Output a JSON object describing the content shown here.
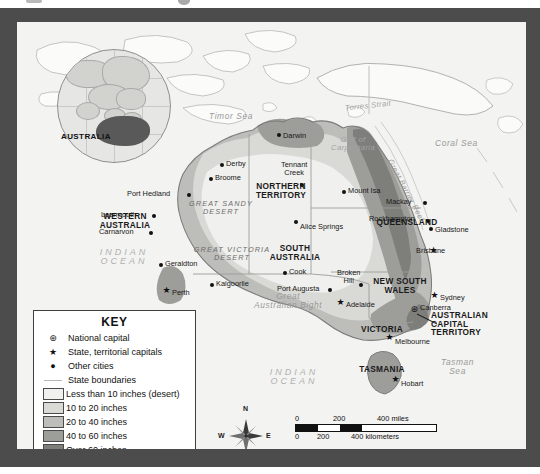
{
  "title_alt": "Australia — Average Annual Precipitation Map",
  "inset": {
    "label": "AUSTRALIA"
  },
  "key": {
    "title": "KEY",
    "symbol_rows": [
      {
        "symbol": "national-capital-icon",
        "glyph": "⊛",
        "label": "National capital"
      },
      {
        "symbol": "state-capital-icon",
        "glyph": "★",
        "label": "State, territorial capitals"
      },
      {
        "symbol": "other-city-icon",
        "glyph": "●",
        "label": "Other cities"
      },
      {
        "symbol": "state-boundary-icon",
        "glyph": "",
        "label": "State boundaries"
      }
    ],
    "swatch_rows": [
      {
        "label": "Less than 10 inches (desert)",
        "color": "#f0f0ee"
      },
      {
        "label": "10 to 20 inches",
        "color": "#d9d9d6"
      },
      {
        "label": "20 to 40 inches",
        "color": "#bdbdba"
      },
      {
        "label": "40 to 60 inches",
        "color": "#9d9d9a"
      },
      {
        "label": "Over 60 inches",
        "color": "#7e7e7b"
      }
    ]
  },
  "compass": {
    "n": "N",
    "s": "S",
    "e": "E",
    "w": "W"
  },
  "scale": {
    "miles": {
      "ticks": [
        "0",
        "200",
        "400 miles"
      ]
    },
    "kilometers": {
      "ticks": [
        "0",
        "200",
        "400 kilometers"
      ]
    }
  },
  "states": [
    {
      "name": "WESTERN\nAUSTRALIA",
      "line1": "WESTERN",
      "line2": "AUSTRALIA",
      "x": 107,
      "y": 196
    },
    {
      "name": "NORTHERN\nTERRITORY",
      "line1": "NORTHERN",
      "line2": "TERRITORY",
      "x": 263,
      "y": 168
    },
    {
      "name": "SOUTH\nAUSTRALIA",
      "line1": "SOUTH",
      "line2": "AUSTRALIA",
      "x": 277,
      "y": 228
    },
    {
      "name": "QUEENSLAND",
      "line1": "QUEENSLAND",
      "line2": "",
      "x": 390,
      "y": 200
    },
    {
      "name": "NEW SOUTH\nWALES",
      "line1": "NEW SOUTH",
      "line2": "WALES",
      "x": 382,
      "y": 262
    },
    {
      "name": "VICTORIA",
      "line1": "VICTORIA",
      "line2": "",
      "x": 365,
      "y": 307
    },
    {
      "name": "TASMANIA",
      "line1": "TASMANIA",
      "line2": "",
      "x": 363,
      "y": 347
    },
    {
      "name": "AUSTRALIAN\nCAPITAL\nTERRITORY",
      "line1": "AUSTRALIAN",
      "line2": "CAPITAL",
      "line3": "TERRITORY",
      "x": 447,
      "y": 297
    }
  ],
  "cities": [
    {
      "label": "Darwin",
      "type": "other",
      "x": 262,
      "y": 113,
      "tx": 268,
      "ty": 110
    },
    {
      "label": "Derby",
      "type": "other",
      "x": 205,
      "y": 143,
      "tx": 211,
      "ty": 139
    },
    {
      "label": "Broome",
      "type": "other",
      "x": 194,
      "y": 157,
      "tx": 200,
      "ty": 153
    },
    {
      "label": "Port Hedland",
      "type": "other",
      "x": 172,
      "y": 173,
      "tx": 113,
      "ty": 170
    },
    {
      "label": "Learmouth",
      "type": "other",
      "x": 137,
      "y": 194,
      "tx": 90,
      "ty": 190
    },
    {
      "label": "Carnarvon",
      "type": "other",
      "x": 134,
      "y": 211,
      "tx": 88,
      "ty": 207
    },
    {
      "label": "Geraldton",
      "type": "other",
      "x": 144,
      "y": 243,
      "tx": 150,
      "ty": 240
    },
    {
      "label": "Perth",
      "type": "star",
      "x": 150,
      "y": 272,
      "tx": 156,
      "ty": 268
    },
    {
      "label": "Kalgoorlie",
      "type": "other",
      "x": 195,
      "y": 263,
      "tx": 201,
      "ty": 259
    },
    {
      "label": "Tennant\nCreek",
      "type": "other",
      "x": 285,
      "y": 163,
      "tx": 268,
      "ty": 143
    },
    {
      "label": "Alice Springs",
      "type": "other",
      "x": 279,
      "y": 200,
      "tx": 285,
      "ty": 203
    },
    {
      "label": "Mount Isa",
      "type": "other",
      "x": 327,
      "y": 170,
      "tx": 333,
      "ty": 166
    },
    {
      "label": "Mackay",
      "type": "other",
      "x": 408,
      "y": 181,
      "tx": 371,
      "ty": 177
    },
    {
      "label": "Rockhampton",
      "type": "other",
      "x": 411,
      "y": 199,
      "tx": 355,
      "ty": 194
    },
    {
      "label": "Gladstone",
      "type": "other",
      "x": 414,
      "y": 207,
      "tx": 420,
      "ty": 205
    },
    {
      "label": "Brisbane",
      "type": "star",
      "x": 417,
      "y": 232,
      "tx": 403,
      "ty": 226
    },
    {
      "label": "Cook",
      "type": "other",
      "x": 268,
      "y": 251,
      "tx": 274,
      "ty": 247
    },
    {
      "label": "Port Augusta",
      "type": "other",
      "x": 313,
      "y": 268,
      "tx": 265,
      "ty": 264
    },
    {
      "label": "Broken\nHill",
      "type": "other",
      "x": 344,
      "y": 263,
      "tx": 325,
      "ty": 250
    },
    {
      "label": "Adelaide",
      "type": "star",
      "x": 324,
      "y": 284,
      "tx": 330,
      "ty": 280
    },
    {
      "label": "Sydney",
      "type": "star",
      "x": 418,
      "y": 277,
      "tx": 424,
      "ty": 273
    },
    {
      "label": "Canberra",
      "type": "capital",
      "x": 398,
      "y": 291,
      "tx": 404,
      "ty": 283
    },
    {
      "label": "Melbourne",
      "type": "star",
      "x": 373,
      "y": 319,
      "tx": 379,
      "ty": 317
    },
    {
      "label": "Hobart",
      "type": "star",
      "x": 379,
      "y": 361,
      "tx": 385,
      "ty": 359
    }
  ],
  "water_labels": [
    {
      "label": "Timor Sea",
      "x": 192,
      "y": 95,
      "size": "md"
    },
    {
      "label": "Torres Strait",
      "x": 335,
      "y": 85,
      "size": "sm"
    },
    {
      "label": "Coral Sea",
      "x": 432,
      "y": 122,
      "size": "md"
    },
    {
      "label": "Gulf of\nCarpentaria",
      "line1": "Gulf of",
      "line2": "Carpentaria",
      "x": 313,
      "y": 118,
      "size": "sm"
    },
    {
      "label": "Great Barrier Reef",
      "x": 392,
      "y": 150,
      "size": "sm"
    },
    {
      "label": "Great\nAustralian Bight",
      "line1": "Great",
      "line2": "Australian Bight",
      "x": 259,
      "y": 275,
      "size": "md"
    },
    {
      "label": "Tasman\nSea",
      "line1": "Tasman",
      "line2": "Sea",
      "x": 444,
      "y": 343,
      "size": "md"
    },
    {
      "label": "INDIAN\nOCEAN",
      "line1": "INDIAN",
      "line2": "OCEAN",
      "x": 101,
      "y": 233,
      "size": "ocean"
    },
    {
      "label": "INDIAN\nOCEAN",
      "line1": "INDIAN",
      "line2": "OCEAN",
      "x": 275,
      "y": 352,
      "size": "ocean"
    }
  ],
  "deserts": [
    {
      "line1": "GREAT SANDY",
      "line2": "DESERT",
      "x": 203,
      "y": 184
    },
    {
      "line1": "GREAT VICTORIA",
      "line2": "DESERT",
      "x": 213,
      "y": 230
    }
  ],
  "colors": {
    "frame": "#4c4c4c",
    "ocean": "#f3f3f1",
    "band_desert": "#f0f0ee",
    "band_10_20": "#d9d9d6",
    "band_20_40": "#bdbdba",
    "band_40_60": "#9d9d9a",
    "band_60_plus": "#7e7e7b",
    "coastline": "#8d8d8b",
    "boundary": "#a9a9a7"
  }
}
